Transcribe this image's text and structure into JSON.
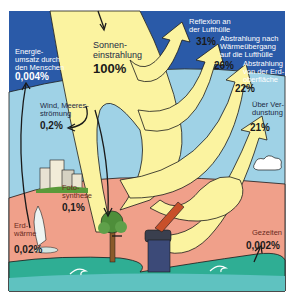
{
  "infographic": {
    "language": "de",
    "colors": {
      "sky_dark": "#2a5aa8",
      "sky_light": "#9fd2e6",
      "ground": "#f0a08a",
      "water": "#2fae94",
      "water_light": "#5fc2c0",
      "sun_beam": "#fbf3a0",
      "outline": "#1a1a1a"
    },
    "incoming": {
      "label": "Sonnen-\neinstrahlung",
      "value": "100%"
    },
    "outgoing": [
      {
        "label": "Reflexion an\nder Lufthülle",
        "value": "31%"
      },
      {
        "label": "Abstrahlung nach\nWärmeübergang\nauf die Lufthülle",
        "value": "26%"
      },
      {
        "label": "Abstrahlung\nvon der Erd-\noberfläche",
        "value": "22%"
      },
      {
        "label": "Über Ver-\ndunstung",
        "value": "21%"
      }
    ],
    "other_flows": [
      {
        "label": "Energie-\numsatz durch\nden Menschen",
        "value": "0,004%"
      },
      {
        "label": "Wind, Meeres-\nströmung",
        "value": "0,2%"
      },
      {
        "label": "Foto-\nsynthese",
        "value": "0,1%"
      },
      {
        "label": "Erd-\nwärme",
        "value": "0,02%"
      },
      {
        "label": "Gezeiten",
        "value": "0,002%"
      }
    ]
  }
}
